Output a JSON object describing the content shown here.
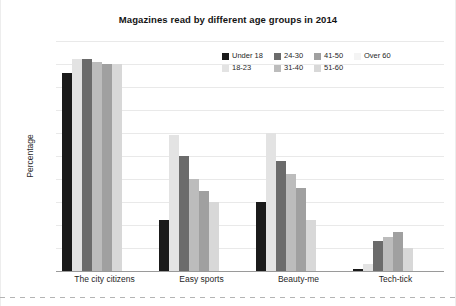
{
  "chart_data": {
    "type": "bar",
    "title": "Magazines read by different age groups in 2014",
    "xlabel": "",
    "ylabel": "Percentage",
    "ylim": [
      0,
      100
    ],
    "yticks": [
      0,
      10,
      20,
      30,
      40,
      50,
      60,
      70,
      80,
      90,
      100
    ],
    "grid": true,
    "legend_position": "upper-right-inside",
    "categories": [
      "The city citizens",
      "Easy sports",
      "Beauty-me",
      "Tech-tick"
    ],
    "series": [
      {
        "name": "Under 18",
        "color": "#1a1a1a",
        "values": [
          86,
          22,
          30,
          1
        ]
      },
      {
        "name": "18-23",
        "color": "#e3e3e3",
        "values": [
          92,
          59,
          60,
          3
        ]
      },
      {
        "name": "24-30",
        "color": "#6b6b6b",
        "values": [
          92,
          50,
          48,
          13
        ]
      },
      {
        "name": "31-40",
        "color": "#bcbcbc",
        "values": [
          91,
          40,
          42,
          15
        ]
      },
      {
        "name": "41-50",
        "color": "#a0a0a0",
        "values": [
          90,
          35,
          36,
          17
        ]
      },
      {
        "name": "51-60",
        "color": "#d8d8d8",
        "values": [
          90,
          30,
          22,
          10
        ]
      },
      {
        "name": "Over 60",
        "color": "#f4f4f4",
        "values": [
          0,
          0,
          0,
          0
        ]
      }
    ]
  },
  "legend": {
    "row1": [
      {
        "label": "Under 18",
        "color": "#1a1a1a"
      },
      {
        "label": "24-30",
        "color": "#6b6b6b"
      },
      {
        "label": "41-50",
        "color": "#a0a0a0"
      },
      {
        "label": "Over 60",
        "color": "#f4f4f4"
      }
    ],
    "row2": [
      {
        "label": "18-23",
        "color": "#e3e3e3"
      },
      {
        "label": "31-40",
        "color": "#bcbcbc"
      },
      {
        "label": "51-60",
        "color": "#d8d8d8"
      }
    ]
  }
}
